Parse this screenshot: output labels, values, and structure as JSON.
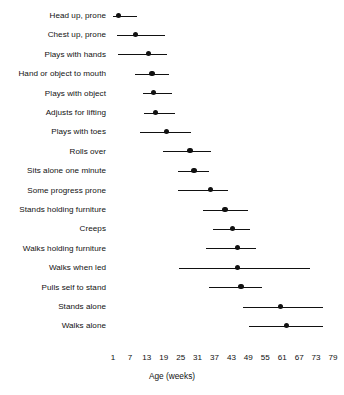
{
  "chart_data": {
    "type": "dot-and-range",
    "title": "",
    "xlabel": "Age (weeks)",
    "ylabel": "",
    "xlim": [
      1,
      79
    ],
    "xticks": [
      1,
      7,
      13,
      19,
      25,
      31,
      37,
      43,
      49,
      55,
      61,
      67,
      73,
      79
    ],
    "xtick_labels": [
      "1",
      "7",
      "13",
      "19",
      "25",
      "31",
      "37",
      "43",
      "49",
      "55",
      "61",
      "67",
      "73",
      "79"
    ],
    "grid": false,
    "legend": null,
    "point_color": "#111111",
    "line_color": "#111111",
    "background_color": "#ffffff",
    "categories": [
      "Head up, prone",
      "Chest up, prone",
      "Plays with hands",
      "Hand or object to mouth",
      "Plays with object",
      "Adjusts for lifting",
      "Plays with toes",
      "Rolls over",
      "Sits alone one minute",
      "Some progress prone",
      "Stands holding furniture",
      "Creeps",
      "Walks holding furniture",
      "Walks when led",
      "Pulls self to stand",
      "Stands alone",
      "Walks alone"
    ],
    "series": [
      {
        "name": "Age at milestone (weeks)",
        "points": [
          {
            "label": "Head up, prone",
            "value": 3,
            "low": 1,
            "high": 9.5
          },
          {
            "label": "Chest up, prone",
            "value": 9,
            "low": 2.5,
            "high": 19.5
          },
          {
            "label": "Plays with hands",
            "value": 13.5,
            "low": 2.8,
            "high": 20
          },
          {
            "label": "Hand or object to mouth",
            "value": 14.8,
            "low": 8.8,
            "high": 21
          },
          {
            "label": "Plays with object",
            "value": 15.5,
            "low": 11.5,
            "high": 21.8
          },
          {
            "label": "Adjusts for lifting",
            "value": 16,
            "low": 12,
            "high": 23
          },
          {
            "label": "Plays with toes",
            "value": 20,
            "low": 10.5,
            "high": 28.5
          },
          {
            "label": "Rolls over",
            "value": 28.3,
            "low": 18.7,
            "high": 35.7
          },
          {
            "label": "Sits alone one minute",
            "value": 29.7,
            "low": 24,
            "high": 35
          },
          {
            "label": "Some progress prone",
            "value": 35.7,
            "low": 24,
            "high": 41.7
          },
          {
            "label": "Stands holding furniture",
            "value": 40.7,
            "low": 33,
            "high": 48.8
          },
          {
            "label": "Creeps",
            "value": 43.5,
            "low": 36.4,
            "high": 49.6
          },
          {
            "label": "Walks holding furniture",
            "value": 45,
            "low": 33.8,
            "high": 51.7
          },
          {
            "label": "Walks when led",
            "value": 45,
            "low": 24.4,
            "high": 70.8
          },
          {
            "label": "Pulls self to stand",
            "value": 46.4,
            "low": 35,
            "high": 53.8
          },
          {
            "label": "Stands alone",
            "value": 60.5,
            "low": 47.1,
            "high": 75.5
          },
          {
            "label": "Walks alone",
            "value": 62.6,
            "low": 49.2,
            "high": 75.5
          }
        ]
      }
    ]
  },
  "axis": {
    "title": "Age (weeks)"
  }
}
